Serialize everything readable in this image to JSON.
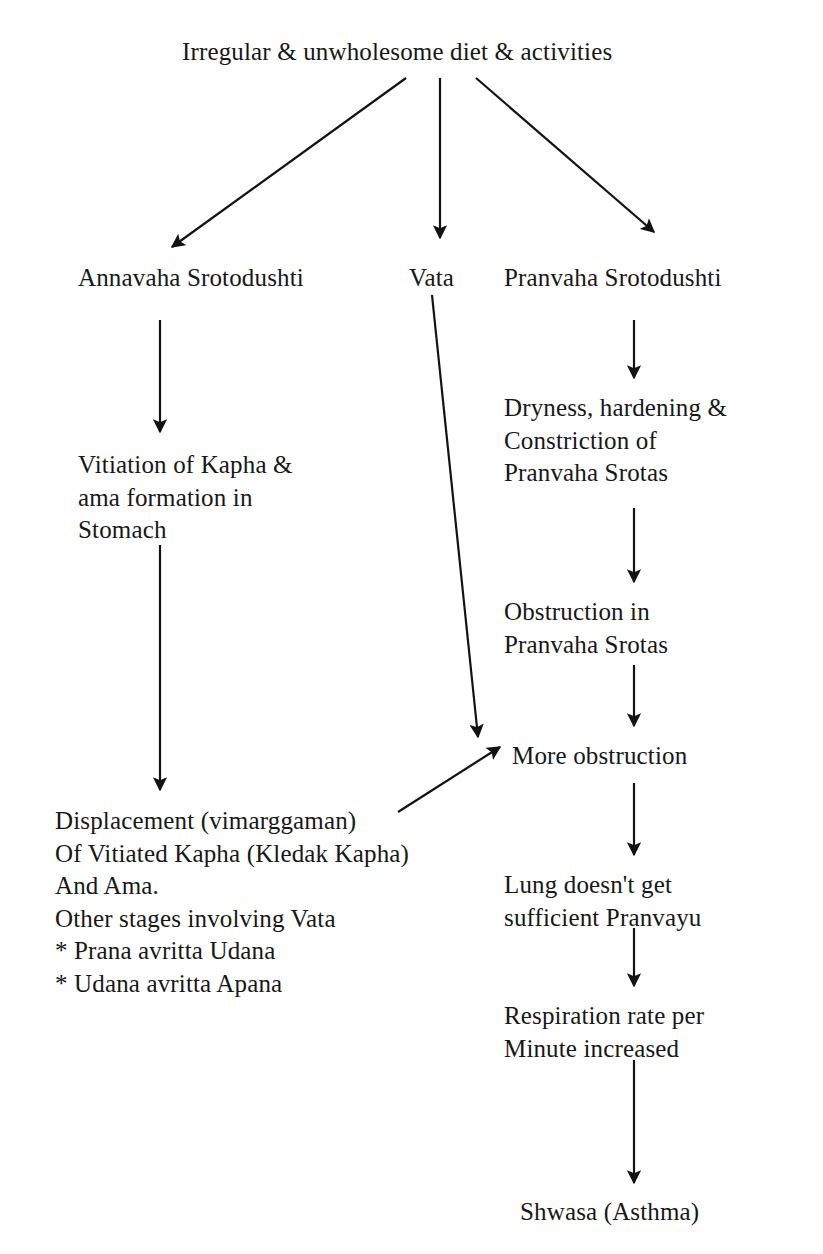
{
  "diagram": {
    "type": "flowchart",
    "background_color": "#ffffff",
    "text_color": "#171717",
    "edge_color": "#121212",
    "nodes": {
      "root": "Irregular & unwholesome diet & activities",
      "annavaha": "Annavaha Srotodushti",
      "vata": "Vata",
      "pranvaha": "Pranvaha Srotodushti",
      "vitiation": "Vitiation of Kapha &\nama formation in\nStomach",
      "dryness": "Dryness, hardening &\nConstriction of\nPranvaha Srotas",
      "obstruction": "Obstruction in\nPranvaha Srotas",
      "more_obstruction": "More obstruction",
      "displacement": "Displacement (vimarggaman)\nOf Vitiated Kapha (Kledak Kapha)\nAnd Ama.\nOther stages involving Vata\n* Prana avritta Udana\n* Udana avritta Apana",
      "lung": "Lung doesn't get\nsufficient Pranvayu",
      "respiration": "Respiration rate per\nMinute increased",
      "outcome": "Shwasa (Asthma)"
    },
    "edges": [
      {
        "name": "root-to-annavaha",
        "from": "root",
        "to": "annavaha",
        "style": "diagonal-down-left"
      },
      {
        "name": "root-to-vata",
        "from": "root",
        "to": "vata",
        "style": "vertical-down"
      },
      {
        "name": "root-to-pranvaha",
        "from": "root",
        "to": "pranvaha",
        "style": "diagonal-down-right"
      },
      {
        "name": "annavaha-to-vitiation",
        "from": "annavaha",
        "to": "vitiation",
        "style": "vertical-down"
      },
      {
        "name": "pranvaha-to-dryness",
        "from": "pranvaha",
        "to": "dryness",
        "style": "vertical-down"
      },
      {
        "name": "vitiation-to-displacement",
        "from": "vitiation",
        "to": "displacement",
        "style": "vertical-down"
      },
      {
        "name": "dryness-to-obstruction",
        "from": "dryness",
        "to": "obstruction",
        "style": "vertical-down"
      },
      {
        "name": "obstruction-to-more-obstruction",
        "from": "obstruction",
        "to": "more_obstruction",
        "style": "vertical-down"
      },
      {
        "name": "vata-to-more-obstruction",
        "from": "vata",
        "to": "more_obstruction",
        "style": "diagonal-down-left"
      },
      {
        "name": "displacement-to-more-obstruction",
        "from": "displacement",
        "to": "more_obstruction",
        "style": "diagonal-up-right"
      },
      {
        "name": "more-obstruction-to-lung",
        "from": "more_obstruction",
        "to": "lung",
        "style": "vertical-down"
      },
      {
        "name": "lung-to-respiration",
        "from": "lung",
        "to": "respiration",
        "style": "vertical-down"
      },
      {
        "name": "respiration-to-outcome",
        "from": "respiration",
        "to": "outcome",
        "style": "vertical-down"
      }
    ]
  }
}
